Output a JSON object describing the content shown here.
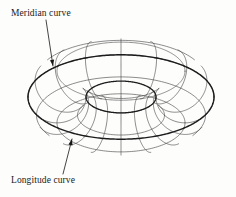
{
  "figure": {
    "kind": "wireframe-torus-diagram",
    "background_color": "#fdfdfc",
    "line_color": "#3a3a3a",
    "silhouette_color": "#1c1c1c",
    "text_color": "#1a1a1a"
  },
  "labels": {
    "meridian": "Meridian curve",
    "longitude": "Longitude curve"
  },
  "leaders": {
    "meridian": {
      "from_x": 46,
      "from_y": 20,
      "to_x": 53,
      "to_y": 66,
      "arrow": "arrow-down-right"
    },
    "longitude": {
      "from_x": 63,
      "from_y": 174,
      "to_x": 72,
      "to_y": 139,
      "arrow": "arrow-up-right"
    }
  },
  "geometry": {
    "center_x": 121,
    "center_y": 97,
    "major_radius": 64,
    "minor_radius": 29,
    "tilt_degrees": 27,
    "meridian_count": 16,
    "longitude_count": 8,
    "outer_left_x": 28,
    "outer_right_x": 215,
    "outer_top_y": 23,
    "outer_bottom_y": 172,
    "hole_center_x": 121,
    "hole_center_y": 96,
    "hole_radius_x": 26,
    "hole_radius_y": 14
  }
}
